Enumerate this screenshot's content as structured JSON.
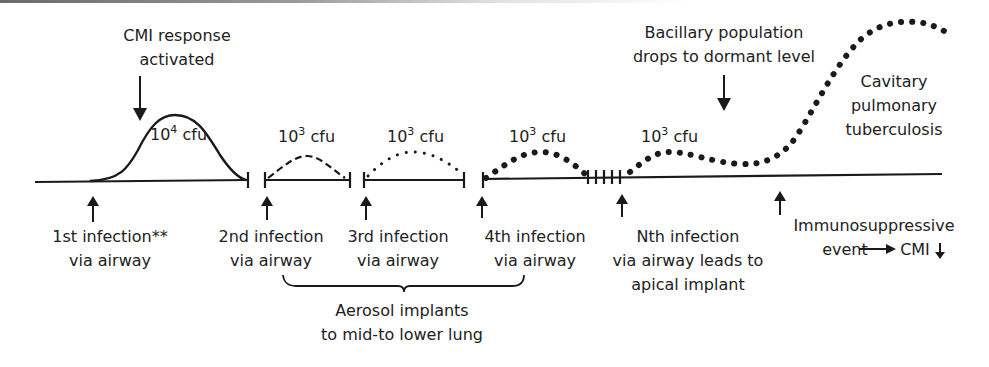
{
  "diagram": {
    "title": "",
    "baseline": {
      "y": 180,
      "x_start": 35,
      "x_end": 942
    },
    "top_labels": {
      "cmi_response": [
        "CMI response",
        "activated"
      ],
      "dormant": [
        "Bacillary population",
        "drops to dormant level"
      ],
      "cavitary": [
        "Cavitary",
        "pulmonary",
        "tuberculosis"
      ]
    },
    "peaks": [
      {
        "base": "10",
        "exp": "4",
        "unit": " cfu",
        "style": "solid"
      },
      {
        "base": "10",
        "exp": "3",
        "unit": " cfu",
        "style": "dashed"
      },
      {
        "base": "10",
        "exp": "3",
        "unit": " cfu",
        "style": "small-dotted"
      },
      {
        "base": "10",
        "exp": "3",
        "unit": " cfu",
        "style": "bold-dotted"
      },
      {
        "base": "10",
        "exp": "3",
        "unit": " cfu",
        "style": "bold-dotted"
      }
    ],
    "events": [
      {
        "lines": [
          "1st infection**",
          "via airway"
        ]
      },
      {
        "lines": [
          "2nd infection",
          "via airway"
        ]
      },
      {
        "lines": [
          "3rd infection",
          "via airway"
        ]
      },
      {
        "lines": [
          "4th infection",
          "via airway"
        ]
      },
      {
        "lines": [
          "Nth infection",
          "via airway leads to",
          "apical implant"
        ]
      },
      {
        "lines": [
          "Immunosuppressive",
          "event",
          "CMI"
        ]
      }
    ],
    "brace_label": [
      "Aerosol implants",
      "to mid-to lower lung"
    ],
    "colors": {
      "ink": "#1a1a1a",
      "background": "#ffffff"
    }
  }
}
